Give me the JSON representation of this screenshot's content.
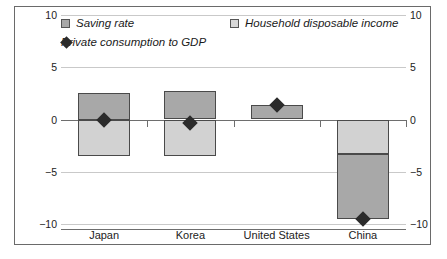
{
  "chart_data": {
    "type": "bar",
    "title": "",
    "xlabel": "",
    "ylabel": "",
    "ylim": [
      -10,
      10
    ],
    "yticks": [
      10,
      5,
      0,
      -5,
      -10
    ],
    "ytick_labels_left": [
      "10",
      "5",
      "0",
      "−5",
      "−10"
    ],
    "ytick_labels_right": [
      "10",
      "5",
      "0",
      "−5",
      "−10"
    ],
    "dual_axis": true,
    "grid": true,
    "legend_position": "top-inside",
    "categories": [
      "Japan",
      "Korea",
      "United States",
      "China"
    ],
    "series": [
      {
        "name": "Saving rate",
        "type": "bar",
        "color": "#a8a8a8",
        "segments": [
          {
            "category": "Japan",
            "from": 0.0,
            "to": 2.5
          },
          {
            "category": "Korea",
            "from": 0.0,
            "to": 2.7
          },
          {
            "category": "United States",
            "from": 0.0,
            "to": 1.4
          },
          {
            "category": "China",
            "from": -3.3,
            "to": -9.5
          }
        ]
      },
      {
        "name": "Household disposable income",
        "type": "bar",
        "color": "#d2d2d2",
        "segments": [
          {
            "category": "Japan",
            "from": 0.0,
            "to": -3.5
          },
          {
            "category": "Korea",
            "from": 0.0,
            "to": -3.5
          },
          {
            "category": "United States",
            "from": 0.0,
            "to": 0.9
          },
          {
            "category": "China",
            "from": 0.0,
            "to": -3.3
          }
        ]
      },
      {
        "name": "Private consumption to GDP",
        "type": "scatter",
        "marker": "diamond",
        "color": "#2b2b2b",
        "values": [
          0.0,
          -0.3,
          1.4,
          -9.5
        ]
      }
    ]
  },
  "legend": {
    "items": [
      {
        "label": "Saving rate",
        "marker": "square-dark"
      },
      {
        "label": "Household disposable income",
        "marker": "square-light"
      },
      {
        "label": "Private consumption to GDP",
        "marker": "diamond-filled"
      }
    ]
  },
  "colors": {
    "saving_rate": "#a8a8a8",
    "household_disposable_income": "#d2d2d2",
    "private_consumption": "#2b2b2b",
    "gridline": "#c9c9c9",
    "axis": "#6e6e6e",
    "border": "#6a6a6a"
  }
}
